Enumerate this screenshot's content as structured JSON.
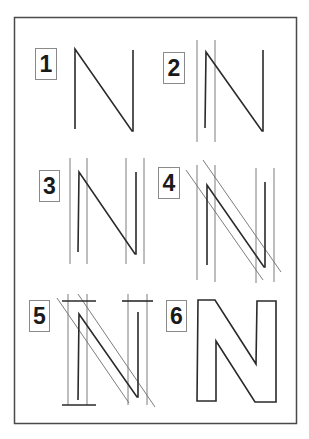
{
  "colors": {
    "stroke": "#2a2a2a",
    "guide": "#6e6e6e",
    "frame": "#4a4a4a",
    "background": "#ffffff"
  },
  "panels": [
    {
      "label": "1",
      "description": "Single-line skeleton of N"
    },
    {
      "label": "2",
      "description": "Stroke-width guides on left stem"
    },
    {
      "label": "3",
      "description": "Stroke-width guides on both stems"
    },
    {
      "label": "4",
      "description": "Diagonal stroke-width guides added"
    },
    {
      "label": "5",
      "description": "Top and bottom guide bars added"
    },
    {
      "label": "6",
      "description": "Finished outlined letter N"
    }
  ]
}
